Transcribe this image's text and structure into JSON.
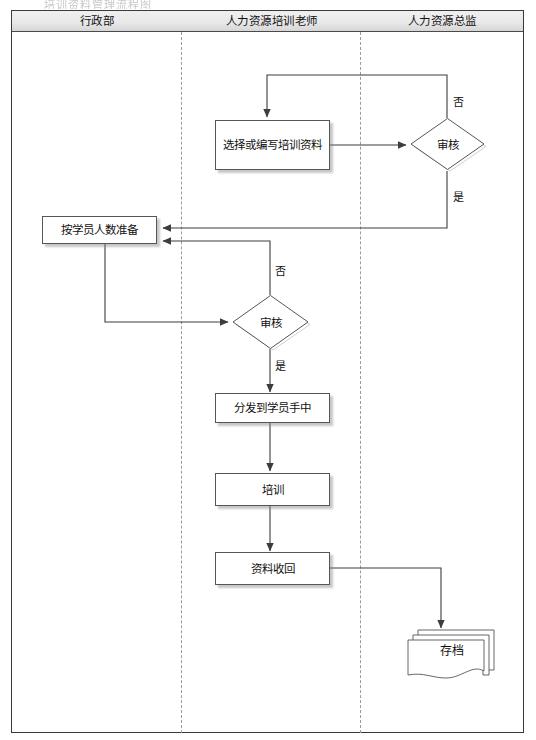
{
  "page": {
    "top_artifact_text": "培训资料管理流程图",
    "title": "培训资料管理流程图"
  },
  "lanes": {
    "headers": [
      {
        "label": "行政部"
      },
      {
        "label": "人力资源培训老师"
      },
      {
        "label": "人力资源总监"
      }
    ]
  },
  "nodes": {
    "prepare_materials": {
      "label": "选择或编写培训资料",
      "type": "process"
    },
    "review_director": {
      "label": "审核",
      "type": "decision"
    },
    "prepare_by_count": {
      "label": "按学员人数准备",
      "type": "process"
    },
    "review_trainer": {
      "label": "审核",
      "type": "decision"
    },
    "distribute": {
      "label": "分发到学员手中",
      "type": "process"
    },
    "training": {
      "label": "培训",
      "type": "process"
    },
    "collect_back": {
      "label": "资料收回",
      "type": "process"
    },
    "archive": {
      "label": "存档",
      "type": "document"
    }
  },
  "edge_labels": {
    "director_no": "否",
    "director_yes": "是",
    "trainer_no": "否",
    "trainer_yes": "是"
  },
  "colors": {
    "frame_border": "#3a3a3a",
    "header_fill": "#e9e9e9",
    "lane_divider": "#9b9b9b",
    "shape_border": "#55565a",
    "shape_fill": "#ffffff",
    "connector": "#3d3d3d",
    "text": "#111111"
  }
}
